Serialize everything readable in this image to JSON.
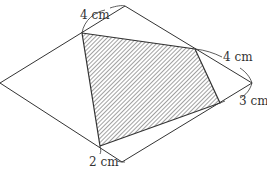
{
  "diagram": {
    "labels": {
      "top_left": "4 cm",
      "right_upper": "4 cm",
      "right_lower": "3 cm",
      "bottom": "2 cm"
    },
    "colors": {
      "line": "#333333",
      "hatch": "#444444",
      "background": "#ffffff"
    }
  }
}
